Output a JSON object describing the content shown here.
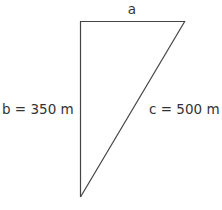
{
  "diagram": {
    "type": "right-triangle",
    "labels": {
      "a": "a",
      "b": "b = 350 m",
      "c": "c = 500 m"
    },
    "sides": {
      "a": {
        "name": "a",
        "value": null,
        "unit": "m"
      },
      "b": {
        "name": "b",
        "value": 350,
        "unit": "m"
      },
      "c": {
        "name": "c",
        "value": 500,
        "unit": "m"
      }
    },
    "colors": {
      "stroke": "#444444",
      "text": "#333333"
    }
  }
}
